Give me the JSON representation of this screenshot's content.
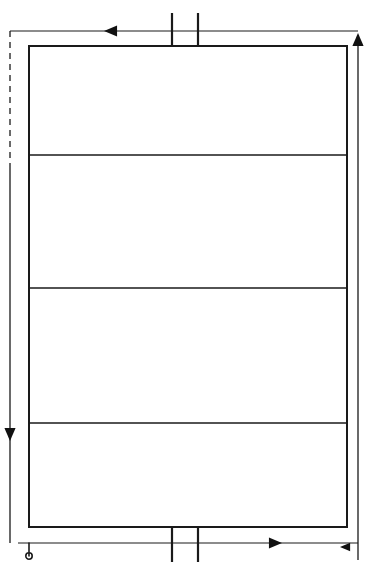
{
  "figure": {
    "width": 371,
    "height": 572,
    "background_color": "#ffffff",
    "line_color": "#1a1a1a",
    "arrow_fill_color": "#111111"
  },
  "main_rectangle": {
    "name": "main-enclosure",
    "x": 29,
    "y": 46,
    "width": 318,
    "height": 481,
    "stroke_width": 2.0
  },
  "dividers": [
    {
      "name": "divider-1",
      "y": 155,
      "x1": 29,
      "x2": 347,
      "stroke_width": 1.4
    },
    {
      "name": "divider-2",
      "y": 288,
      "x1": 29,
      "x2": 347,
      "stroke_width": 1.4
    },
    {
      "name": "divider-3",
      "y": 423,
      "x1": 29,
      "x2": 347,
      "stroke_width": 1.4
    }
  ],
  "top_conductor": {
    "name": "top-horizontal-line",
    "y": 31,
    "x1": 10,
    "x2": 358,
    "stroke_width": 1.2,
    "arrow": {
      "direction": "left",
      "x": 113,
      "y": 31,
      "size": 9
    }
  },
  "bottom_conductor": {
    "name": "bottom-horizontal-line",
    "y": 543,
    "x1": 18,
    "x2": 358,
    "stroke_width": 1.2,
    "arrow": {
      "direction": "right",
      "x": 273,
      "y": 543,
      "size": 9
    }
  },
  "left_conductor": {
    "name": "left-vertical-line",
    "x": 10,
    "y_top": 31,
    "y_bottom": 543,
    "dash_end_y": 166,
    "stroke_width": 1.3,
    "arrow": {
      "direction": "down",
      "x": 10,
      "y": 432,
      "size": 9
    }
  },
  "right_conductor": {
    "name": "right-vertical-line",
    "x": 358,
    "y_top": 42,
    "y_bottom": 560,
    "stroke_width": 1.3,
    "arrow": {
      "direction": "up",
      "x": 358,
      "y": 42,
      "size": 9
    }
  },
  "tick_marks": {
    "top": {
      "name": "top-terminal-ticks",
      "y1": 13,
      "y2": 47,
      "x_positions": [
        172,
        198
      ],
      "stroke_width": 2.2
    },
    "bottom": {
      "name": "bottom-terminal-ticks",
      "y1": 527,
      "y2": 562,
      "x_positions": [
        172,
        198
      ],
      "stroke_width": 2.2
    }
  },
  "terminals": [
    {
      "name": "bottom-left-hook-terminal",
      "type": "hook",
      "x": 29,
      "y_start": 543,
      "y_end": 556,
      "stroke_width": 1.6
    },
    {
      "name": "bottom-right-arrow-terminal",
      "type": "arrow-left",
      "x": 347,
      "y": 547,
      "size": 7
    }
  ]
}
